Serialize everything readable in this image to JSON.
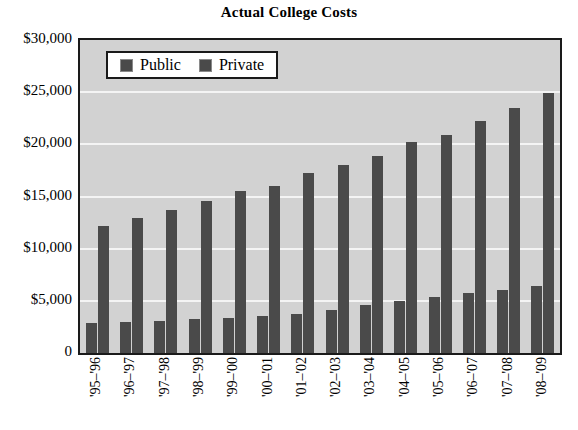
{
  "chart_data": {
    "type": "bar",
    "title": "Actual College Costs",
    "xlabel": "",
    "ylabel": "",
    "ylim": [
      0,
      30000
    ],
    "ytick_values": [
      0,
      5000,
      10000,
      15000,
      20000,
      25000,
      30000
    ],
    "ytick_labels": [
      "0",
      "$5,000",
      "$10,000",
      "$15,000",
      "$20,000",
      "$25,000",
      "$30,000"
    ],
    "grid": true,
    "grid_axis": "y",
    "legend_position": "upper left",
    "categories": [
      "'95–'96",
      "'96–'97",
      "'97–'98",
      "'98–'99",
      "'99–'00",
      "'00–'01",
      "'01–'02",
      "'02–'03",
      "'03–'04",
      "'04–'05",
      "'05–'06",
      "'06–'07",
      "'07–'08",
      "'08–'09"
    ],
    "series": [
      {
        "name": "Public",
        "color": "#4a4a4a",
        "values": [
          2860,
          2980,
          3110,
          3250,
          3360,
          3510,
          3760,
          4100,
          4650,
          5000,
          5350,
          5750,
          6000,
          6400
        ]
      },
      {
        "name": "Private",
        "color": "#4a4a4a",
        "values": [
          12200,
          12900,
          13700,
          14600,
          15500,
          16000,
          17300,
          18000,
          18900,
          20200,
          20900,
          22200,
          23500,
          24900
        ]
      }
    ]
  },
  "legend": {
    "entries": [
      {
        "label": "Public",
        "swatch": "dark-gray-square"
      },
      {
        "label": "Private",
        "swatch": "dark-gray-square"
      }
    ]
  },
  "colors": {
    "bar": "#4a4a4a",
    "plot_background": "#d2d2d2",
    "gridline": "#f4f4f4",
    "axis_border": "#1a1a1a",
    "page_background": "#ffffff",
    "text": "#000000"
  }
}
